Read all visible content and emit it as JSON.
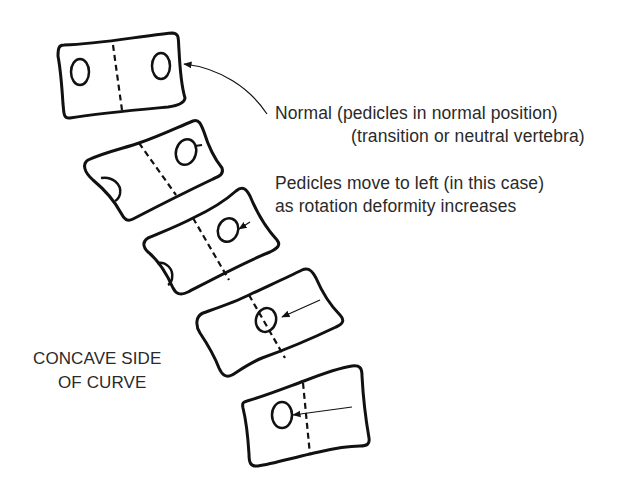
{
  "figure": {
    "labels": {
      "normal_line1": "Normal (pedicles in normal position)",
      "normal_line2": "(transition or neutral vertebra)",
      "rotation_line1": "Pedicles move to left (in this case)",
      "rotation_line2": "as rotation deformity increases",
      "concave_line1": "CONCAVE SIDE",
      "concave_line2": "OF CURVE"
    },
    "vertebrae": [
      {
        "id": 1,
        "description": "normal / neutral vertebra, pedicles symmetric"
      },
      {
        "id": 2,
        "description": "slight rotation, pedicles shifting left"
      },
      {
        "id": 3,
        "description": "moderate rotation"
      },
      {
        "id": 4,
        "description": "pedicle at midline"
      },
      {
        "id": 5,
        "description": "severe rotation, pedicle past midline"
      }
    ],
    "colors": {
      "ink": "#111111",
      "text": "#2a2a2a",
      "background": "#ffffff"
    }
  }
}
